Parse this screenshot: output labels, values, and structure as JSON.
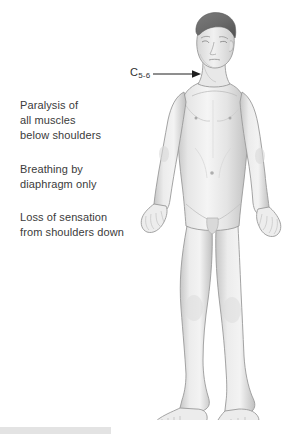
{
  "illustration": {
    "title": "C5-6 spinal cord injury effects",
    "subject": "standing adult male anatomical figure, anterior view, grayscale"
  },
  "pointer_label": {
    "prefix": "C",
    "subscript": "5-6",
    "full_text": "C5-6",
    "icon": "leader-line-arrow-icon"
  },
  "annotations": [
    {
      "id": "paralysis",
      "text": "Paralysis of\nall muscles\nbelow shoulders"
    },
    {
      "id": "breathing",
      "text": "Breathing by\ndiaphragm only"
    },
    {
      "id": "sensation",
      "text": "Loss of sensation\nfrom shoulders down"
    }
  ],
  "watermark": {
    "text": ""
  },
  "colors": {
    "background": "#ffffff",
    "text": "#3b3b3b",
    "label_text": "#2f2f2f",
    "arrow": "#1f1f1f",
    "skin_light": "#f2f2f2",
    "skin_mid": "#dcdcdc",
    "skin_shadow": "#c2c2c2",
    "skin_deep": "#a8a8a8",
    "outline": "#9a9a9a",
    "hair": "#6d6d6d",
    "hair_shadow": "#575757",
    "watermark_strip": "#e3e3e3"
  }
}
